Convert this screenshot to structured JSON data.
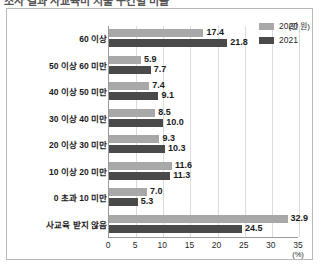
{
  "top_clipped_text": "조사 결과 사교육비 지출 구간별 비율",
  "chart_data": {
    "type": "bar",
    "orientation": "horizontal",
    "title": "",
    "xlabel": "(%)",
    "ylabel": "(만 원)",
    "categories": [
      "60 이상",
      "50 이상  60 미만",
      "40 이상 50 미만",
      "30 이상 40 미만",
      "20 이상 30 미만",
      "10 이상 20 미만",
      "0 초과 10 미만",
      "사교육 받지 않음"
    ],
    "series": [
      {
        "name": "2020",
        "color": "#a8a8a8",
        "values": [
          17.4,
          5.9,
          7.4,
          8.5,
          9.3,
          11.6,
          7.0,
          32.9
        ]
      },
      {
        "name": "2021",
        "color": "#4a4a4a",
        "values": [
          21.8,
          7.7,
          9.1,
          10.0,
          10.3,
          11.3,
          5.3,
          24.5
        ]
      }
    ],
    "xlim": [
      0,
      35
    ],
    "xticks": [
      0,
      5,
      10,
      15,
      20,
      25,
      30,
      35
    ],
    "xtick_labels": [
      "0",
      "5",
      "10",
      "15",
      "20",
      "25",
      "30",
      "35"
    ],
    "grid": true,
    "grid_axis": "x",
    "legend_position": "top-right",
    "value_labels": true,
    "value_label_format": "0.0"
  }
}
